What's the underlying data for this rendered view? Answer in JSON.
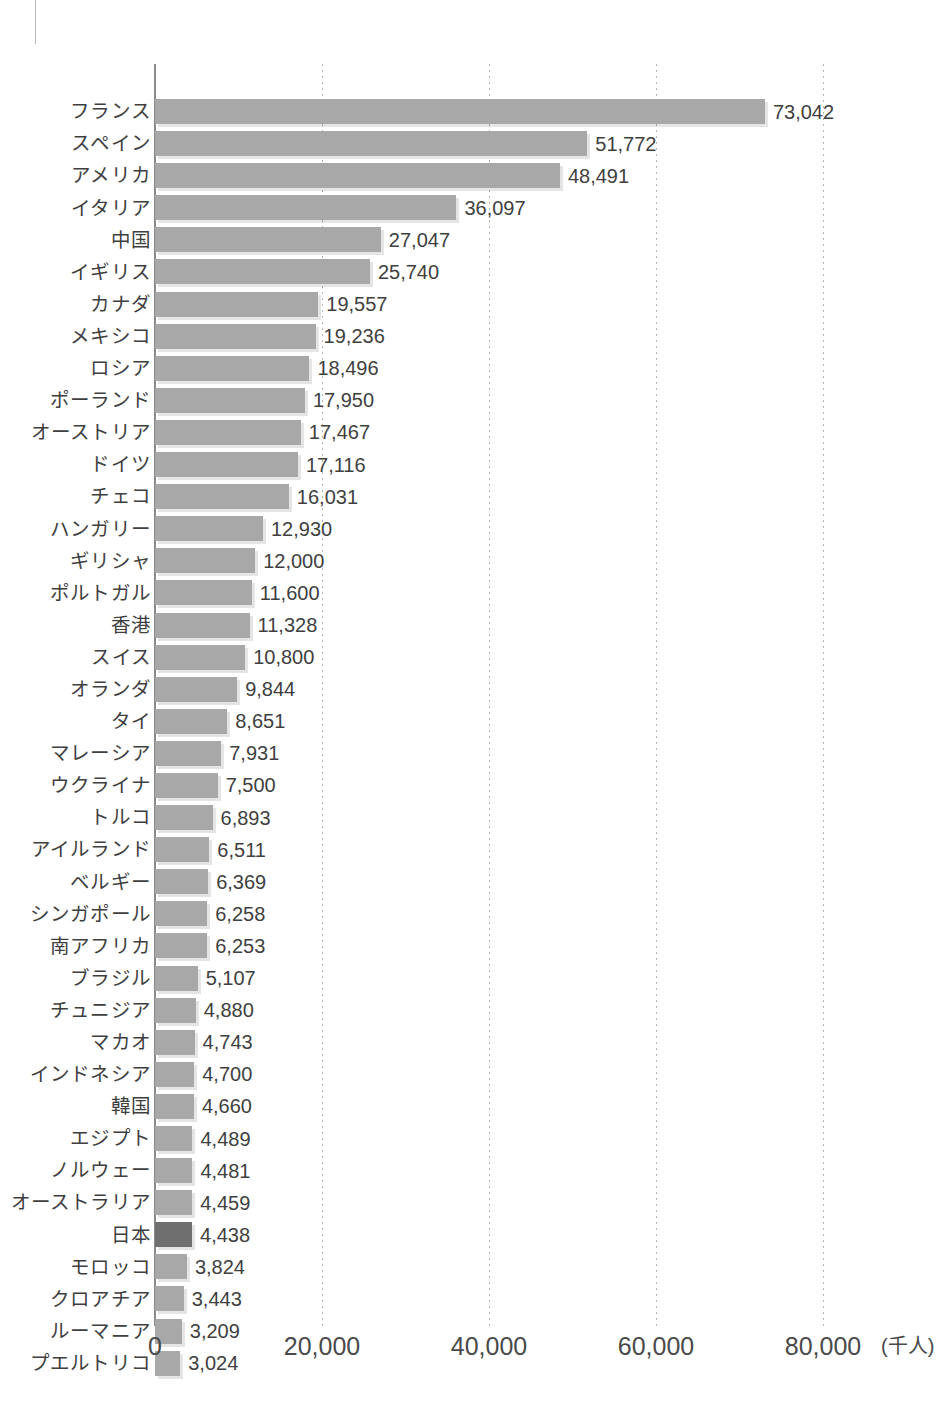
{
  "chart_data": {
    "type": "bar",
    "orientation": "horizontal",
    "title": "",
    "xlabel": "(千人)",
    "ylabel": "",
    "xlim": [
      0,
      86000
    ],
    "grid": true,
    "legend": null,
    "unit_label": "(千人)",
    "x_ticks": [
      {
        "value": 0,
        "label": "0"
      },
      {
        "value": 20000,
        "label": "20,000"
      },
      {
        "value": 40000,
        "label": "40,000"
      },
      {
        "value": 60000,
        "label": "60,000"
      },
      {
        "value": 80000,
        "label": "80,000"
      }
    ],
    "highlight_category": "日本",
    "categories": [
      "フランス",
      "スペイン",
      "アメリカ",
      "イタリア",
      "中国",
      "イギリス",
      "カナダ",
      "メキシコ",
      "ロシア",
      "ポーランド",
      "オーストリア",
      "ドイツ",
      "チェコ",
      "ハンガリー",
      "ギリシャ",
      "ポルトガル",
      "香港",
      "スイス",
      "オランダ",
      "タイ",
      "マレーシア",
      "ウクライナ",
      "トルコ",
      "アイルランド",
      "ベルギー",
      "シンガポール",
      "南アフリカ",
      "ブラジル",
      "チュニジア",
      "マカオ",
      "インドネシア",
      "韓国",
      "エジプト",
      "ノルウェー",
      "オーストラリア",
      "日本",
      "モロッコ",
      "クロアチア",
      "ルーマニア",
      "プエルトリコ"
    ],
    "values": [
      73042,
      51772,
      48491,
      36097,
      27047,
      25740,
      19557,
      19236,
      18496,
      17950,
      17467,
      17116,
      16031,
      12930,
      12000,
      11600,
      11328,
      10800,
      9844,
      8651,
      7931,
      7500,
      6893,
      6511,
      6369,
      6258,
      6253,
      5107,
      4880,
      4743,
      4700,
      4660,
      4489,
      4481,
      4459,
      4438,
      3824,
      3443,
      3209,
      3024
    ],
    "value_labels": [
      "73,042",
      "51,772",
      "48,491",
      "36,097",
      "27,047",
      "25,740",
      "19,557",
      "19,236",
      "18,496",
      "17,950",
      "17,467",
      "17,116",
      "16,031",
      "12,930",
      "12,000",
      "11,600",
      "11,328",
      "10,800",
      "9,844",
      "8,651",
      "7,931",
      "7,500",
      "6,893",
      "6,511",
      "6,369",
      "6,258",
      "6,253",
      "5,107",
      "4,880",
      "4,743",
      "4,700",
      "4,660",
      "4,489",
      "4,481",
      "4,459",
      "4,438",
      "3,824",
      "3,443",
      "3,209",
      "3,024"
    ],
    "colors": {
      "bar": "#a8a8a8",
      "bar_highlight": "#6f6f6f",
      "axis": "#8a8a8a",
      "gridline": "#b5b5b5",
      "text": "#3f3f3f"
    }
  },
  "footer": {
    "note": ""
  }
}
